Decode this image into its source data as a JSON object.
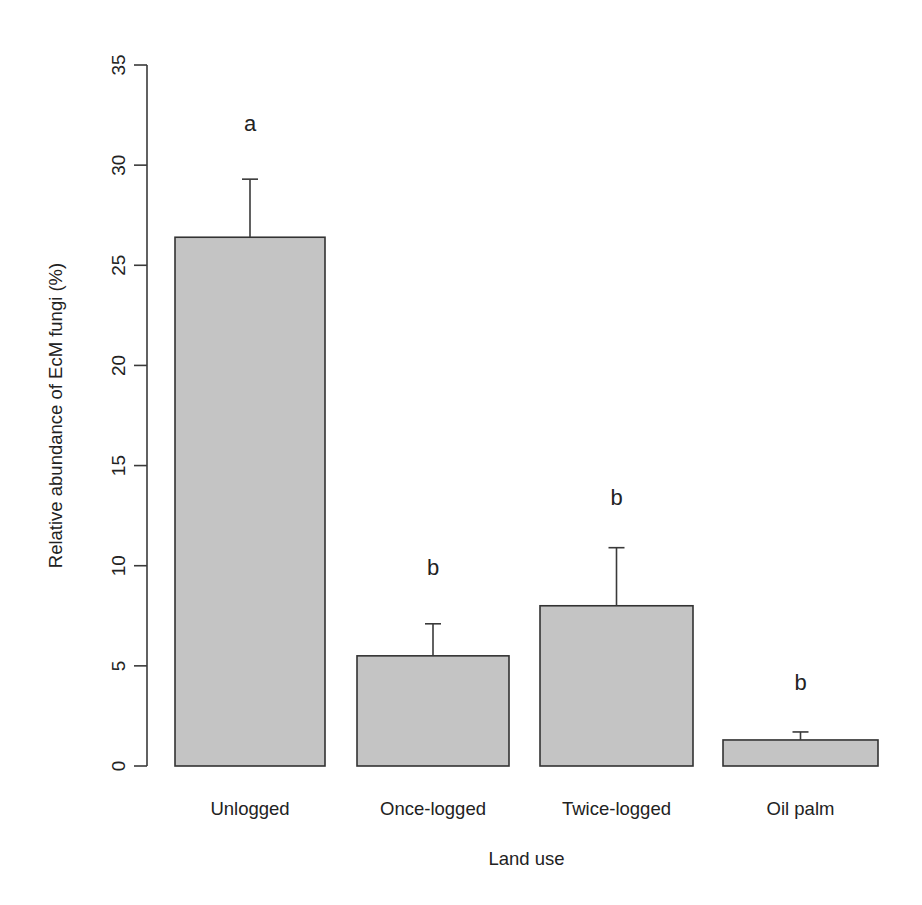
{
  "chart_data": {
    "type": "bar",
    "title": "",
    "xlabel": "Land use",
    "ylabel": "Relative abundance of EcM fungi (%)",
    "categories": [
      "Unlogged",
      "Once-logged",
      "Twice-logged",
      "Oil palm"
    ],
    "values": [
      26.4,
      5.5,
      8.0,
      1.3
    ],
    "error_upper": [
      29.3,
      7.1,
      10.9,
      1.7
    ],
    "error_sizes": [
      2.9,
      1.6,
      2.9,
      0.4
    ],
    "significance_letters": [
      "a",
      "b",
      "b",
      "b"
    ],
    "letter_positions": [
      32.1,
      9.9,
      13.4,
      4.2
    ],
    "ylim": [
      0,
      35
    ],
    "yticks": [
      0,
      5,
      10,
      15,
      20,
      25,
      30,
      35
    ],
    "grid": false,
    "legend": null,
    "bar_color": "#c4c4c4",
    "bar_border_color": "#333333",
    "axis_color": "#3a3a3a",
    "text_color": "#222222"
  },
  "layout": {
    "axis_x": 147,
    "y_zero_px": 766,
    "y_top_px": 65,
    "bars_px": [
      {
        "x0": 175,
        "x1": 325
      },
      {
        "x0": 357,
        "x1": 509
      },
      {
        "x0": 540,
        "x1": 693
      },
      {
        "x0": 723,
        "x1": 878
      }
    ],
    "cat_label_y": 815,
    "xlabel_y": 865,
    "ylabel_x": 62
  }
}
